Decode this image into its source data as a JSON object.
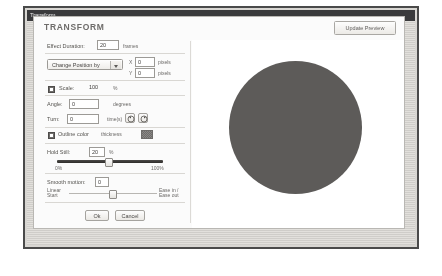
{
  "window": {
    "title": "Transform"
  },
  "dialog": {
    "title": "TRANSFORM",
    "update_preview_label": "Update Preview"
  },
  "controls": {
    "effect_duration": {
      "label": "Effect Duration:",
      "value": "20",
      "unit": "frames"
    },
    "change_position": {
      "label": "Change Position by",
      "x_prefix": "X",
      "x_value": "0",
      "x_unit": "pixels",
      "y_prefix": "Y",
      "y_value": "0",
      "y_unit": "pixels"
    },
    "scale": {
      "label": "Scale:",
      "value": "100",
      "unit": "%",
      "checked": true
    },
    "angle": {
      "label": "Angle:",
      "value": "0",
      "unit": "degrees"
    },
    "turn": {
      "label": "Turn:",
      "value": "0",
      "unit": "time(s)",
      "ccw_icon": "rotate-counter-clockwise-icon",
      "cw_icon": "rotate-clockwise-icon"
    },
    "outline": {
      "label": "Outline color",
      "secondary_label": "thickness",
      "checked": true,
      "swatch_color": "#7a7876"
    },
    "hold_still": {
      "label": "Hold Still:",
      "value": "20",
      "unit": "%",
      "slider_percent": 48,
      "left_label": "0%",
      "right_label": "100%"
    },
    "smooth_motion": {
      "label": "Smooth motion:",
      "value": "0",
      "slider_percent": 46,
      "left_label": "Linear\nStart",
      "right_label": "Ease in /\nEase out"
    }
  },
  "buttons": {
    "ok": "Ok",
    "cancel": "Cancel"
  },
  "preview": {
    "shape": "circle",
    "shape_color": "#5d5b59"
  }
}
